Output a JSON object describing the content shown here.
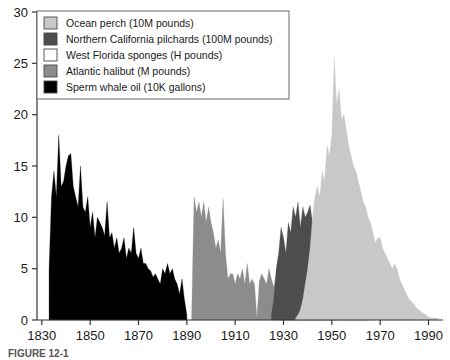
{
  "figure": {
    "caption": "FIGURE 12-1"
  },
  "legend": {
    "position": "top-left",
    "items": [
      {
        "label": "Ocean perch (10M pounds)",
        "color": "#c8c8c8",
        "key": "ocean_perch"
      },
      {
        "label": "Northern California pilchards (100M pounds)",
        "color": "#4d4d4d",
        "key": "pilchards"
      },
      {
        "label": "West Florida sponges (H pounds)",
        "color": "#ffffff",
        "key": "sponges"
      },
      {
        "label": "Atlantic halibut (M pounds)",
        "color": "#8c8c8c",
        "key": "halibut"
      },
      {
        "label": "Sperm whale oil (10K gallons)",
        "color": "#000000",
        "key": "sperm_whale_oil"
      }
    ]
  },
  "chart_data": {
    "type": "area",
    "title": "",
    "xlabel": "",
    "ylabel": "",
    "xlim": [
      1828,
      1996
    ],
    "ylim": [
      0,
      30
    ],
    "xticks": [
      1830,
      1850,
      1870,
      1890,
      1910,
      1930,
      1950,
      1970,
      1990
    ],
    "yticks": [
      0,
      5,
      10,
      15,
      20,
      25,
      30
    ],
    "grid": false,
    "legend_position": "top-left",
    "series": [
      {
        "name": "Sperm whale oil (10K gallons)",
        "color": "#000000",
        "x": [
          1833,
          1834,
          1835,
          1836,
          1837,
          1838,
          1839,
          1840,
          1841,
          1842,
          1843,
          1844,
          1845,
          1846,
          1847,
          1848,
          1849,
          1850,
          1851,
          1852,
          1853,
          1854,
          1855,
          1856,
          1857,
          1858,
          1859,
          1860,
          1861,
          1862,
          1863,
          1864,
          1865,
          1866,
          1867,
          1868,
          1869,
          1870,
          1871,
          1872,
          1873,
          1874,
          1875,
          1876,
          1877,
          1878,
          1879,
          1880,
          1881,
          1882,
          1883,
          1884,
          1885,
          1886,
          1887,
          1888,
          1889,
          1890
        ],
        "values": [
          5.0,
          12.0,
          14.5,
          12.0,
          18.0,
          13.0,
          13.5,
          15.0,
          16.0,
          16.2,
          13.0,
          12.0,
          11.0,
          15.0,
          11.0,
          10.5,
          12.0,
          9.0,
          10.5,
          8.0,
          10.0,
          9.5,
          9.0,
          8.2,
          11.5,
          8.0,
          8.5,
          7.0,
          8.0,
          6.5,
          7.0,
          8.0,
          6.0,
          7.0,
          6.5,
          9.0,
          6.5,
          6.0,
          7.0,
          5.5,
          5.5,
          5.0,
          4.8,
          4.2,
          4.5,
          4.0,
          3.5,
          5.0,
          4.5,
          5.5,
          4.5,
          5.0,
          4.0,
          3.5,
          2.5,
          4.0,
          2.0,
          0.5
        ]
      },
      {
        "name": "Atlantic halibut (M pounds)",
        "color": "#8c8c8c",
        "x": [
          1892,
          1893,
          1894,
          1895,
          1896,
          1897,
          1898,
          1899,
          1900,
          1901,
          1902,
          1903,
          1904,
          1905,
          1906,
          1907,
          1908,
          1909,
          1910,
          1911,
          1912,
          1913,
          1914,
          1915,
          1916,
          1917,
          1918,
          1919,
          1920,
          1921,
          1922,
          1923,
          1924,
          1925,
          1926,
          1927,
          1928,
          1929,
          1930,
          1931,
          1932,
          1933,
          1934,
          1935,
          1936,
          1937,
          1938,
          1939,
          1940,
          1941,
          1942,
          1943,
          1944,
          1945,
          1946,
          1947,
          1948,
          1949,
          1950,
          1951,
          1952,
          1953,
          1954,
          1955,
          1956,
          1957,
          1958,
          1959,
          1960,
          1961,
          1962,
          1963,
          1964,
          1965
        ],
        "values": [
          0.5,
          12.0,
          10.5,
          11.5,
          10.0,
          11.5,
          9.5,
          11.0,
          9.5,
          8.5,
          7.0,
          7.8,
          6.5,
          11.8,
          6.5,
          4.0,
          4.5,
          4.5,
          3.5,
          4.5,
          4.0,
          5.0,
          3.5,
          5.5,
          3.5,
          4.0,
          3.5,
          0.2,
          3.8,
          4.5,
          4.0,
          3.5,
          5.0,
          4.0,
          3.2,
          4.5,
          3.0,
          3.5,
          4.5,
          3.0,
          3.5,
          3.0,
          2.5,
          2.2,
          2.0,
          2.2,
          1.5,
          1.2,
          1.0,
          1.5,
          1.2,
          1.5,
          2.0,
          1.5,
          1.2,
          1.0,
          1.0,
          0.8,
          0.7,
          0.6,
          0.5,
          0.5,
          0.4,
          0.4,
          0.3,
          0.3,
          0.3,
          0.2,
          0.2,
          0.2,
          0.2,
          0.1,
          0.1,
          0.1
        ]
      },
      {
        "name": "West Florida sponges (H pounds)",
        "color": "#ffffff",
        "x": [
          1928,
          1929,
          1930,
          1931,
          1932,
          1933,
          1934,
          1935,
          1936,
          1937,
          1938,
          1939,
          1940,
          1941,
          1942,
          1943,
          1944,
          1945,
          1946,
          1947,
          1948,
          1949,
          1950,
          1951,
          1952
        ],
        "values": [
          0.0,
          0.5,
          1.5,
          2.5,
          2.0,
          3.5,
          3.0,
          3.8,
          3.0,
          3.5,
          3.2,
          3.0,
          2.8,
          3.5,
          3.0,
          3.2,
          2.5,
          2.0,
          1.5,
          1.2,
          0.8,
          0.5,
          0.3,
          0.2,
          0.0
        ]
      },
      {
        "name": "Northern California pilchards (100M pounds)",
        "color": "#4d4d4d",
        "x": [
          1925,
          1926,
          1927,
          1928,
          1929,
          1930,
          1931,
          1932,
          1933,
          1934,
          1935,
          1936,
          1937,
          1938,
          1939,
          1940,
          1941,
          1942,
          1943,
          1944,
          1945,
          1946,
          1947,
          1948,
          1949,
          1950,
          1951,
          1952,
          1953,
          1954,
          1955,
          1956,
          1957,
          1958,
          1959,
          1960,
          1961,
          1962,
          1963,
          1964,
          1965
        ],
        "values": [
          0.5,
          2.0,
          5.0,
          6.5,
          9.0,
          8.0,
          6.5,
          9.5,
          8.5,
          11.0,
          10.0,
          11.5,
          9.0,
          11.0,
          10.0,
          10.5,
          11.2,
          9.5,
          8.0,
          7.0,
          5.5,
          5.0,
          3.5,
          2.5,
          3.0,
          2.0,
          1.5,
          3.5,
          1.0,
          0.8,
          0.8,
          1.5,
          0.5,
          0.3,
          0.2,
          0.2,
          0.1,
          0.1,
          0.1,
          0.1,
          0.1
        ]
      },
      {
        "name": "Ocean perch (10M pounds)",
        "color": "#c8c8c8",
        "x": [
          1935,
          1936,
          1937,
          1938,
          1939,
          1940,
          1941,
          1942,
          1943,
          1944,
          1945,
          1946,
          1947,
          1948,
          1949,
          1950,
          1951,
          1952,
          1953,
          1954,
          1955,
          1956,
          1957,
          1958,
          1959,
          1960,
          1961,
          1962,
          1963,
          1964,
          1965,
          1966,
          1967,
          1968,
          1969,
          1970,
          1971,
          1972,
          1973,
          1974,
          1975,
          1976,
          1977,
          1978,
          1979,
          1980,
          1981,
          1982,
          1983,
          1984,
          1985,
          1986,
          1987,
          1988,
          1989,
          1990,
          1991,
          1992,
          1993,
          1994
        ],
        "values": [
          0.2,
          0.5,
          1.0,
          2.0,
          3.5,
          5.0,
          7.0,
          10.0,
          12.0,
          13.0,
          12.0,
          14.5,
          13.5,
          17.0,
          16.0,
          18.0,
          25.5,
          21.0,
          22.5,
          19.5,
          20.0,
          18.5,
          17.0,
          16.0,
          15.0,
          14.5,
          13.5,
          12.5,
          11.5,
          11.0,
          10.0,
          9.5,
          8.5,
          7.5,
          8.0,
          8.0,
          7.0,
          6.5,
          6.0,
          5.5,
          5.0,
          5.5,
          5.0,
          4.0,
          3.5,
          3.0,
          2.5,
          2.0,
          1.8,
          1.5,
          1.2,
          1.0,
          0.8,
          0.6,
          0.5,
          0.3,
          0.2,
          0.2,
          0.2,
          0.2
        ]
      }
    ]
  }
}
